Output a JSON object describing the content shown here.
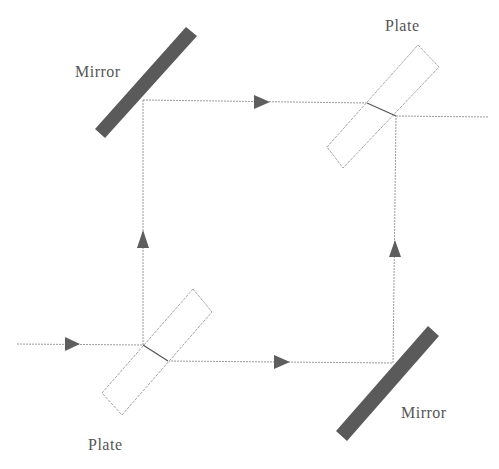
{
  "diagram": {
    "colors": {
      "beam": "#9a9a9a",
      "mirror": "#5a5a5a",
      "plate_outline": "#a8a8a8",
      "arrow": "#5e5e5e",
      "label": "#555555"
    },
    "labels": {
      "mirror_top_left": "Mirror",
      "plate_top_right": "Plate",
      "plate_bottom_left": "Plate",
      "mirror_bottom_right": "Mirror"
    },
    "components": [
      {
        "id": "mirror-top-left",
        "type": "mirror",
        "label": "Mirror"
      },
      {
        "id": "plate-top-right",
        "type": "beam-splitter-plate",
        "label": "Plate"
      },
      {
        "id": "plate-bottom-left",
        "type": "beam-splitter-plate",
        "label": "Plate"
      },
      {
        "id": "mirror-bottom-right",
        "type": "mirror",
        "label": "Mirror"
      }
    ],
    "beams": [
      {
        "id": "input",
        "from": "left",
        "to": "plate-bottom-left",
        "direction": "right"
      },
      {
        "id": "lower-arm",
        "from": "plate-bottom-left",
        "to": "mirror-bottom-right",
        "direction": "right"
      },
      {
        "id": "left-arm",
        "from": "plate-bottom-left",
        "to": "mirror-top-left",
        "direction": "up"
      },
      {
        "id": "upper-arm",
        "from": "mirror-top-left",
        "to": "plate-top-right",
        "direction": "right"
      },
      {
        "id": "right-arm",
        "from": "mirror-bottom-right",
        "to": "plate-top-right",
        "direction": "up"
      },
      {
        "id": "output",
        "from": "plate-top-right",
        "to": "right",
        "direction": "right"
      }
    ]
  }
}
